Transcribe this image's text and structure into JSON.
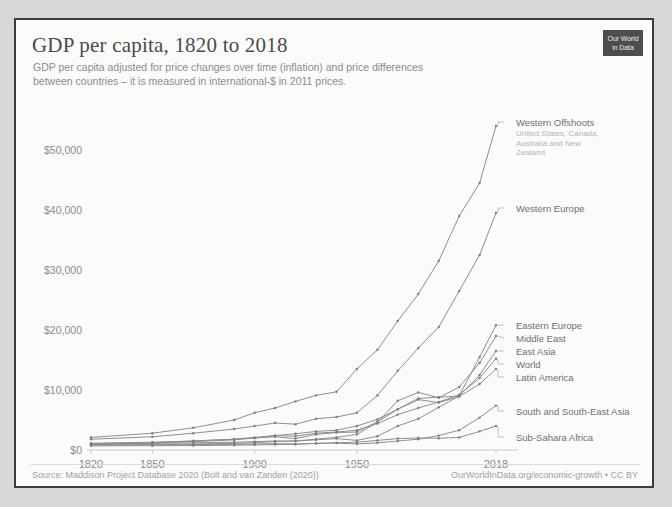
{
  "header": {
    "title": "GDP per capita, 1820 to 2018",
    "subtitle": "GDP per capita adjusted for price changes over time (inflation) and price differences between countries – it is measured in international-$ in 2011 prices.",
    "logo_line1": "Our World",
    "logo_line2": "in Data"
  },
  "footer": {
    "source": "Source: Maddison Project Database 2020 (Bolt and van Zanden (2020))",
    "credit": "OurWorldInData.org/economic-growth • CC BY"
  },
  "colors": {
    "line": "#8e8e8e",
    "text": "#8a8a8a",
    "background": "#fbfbfa",
    "frame": "#3a3a3a",
    "logo": "#4d4d4d"
  },
  "chart_data": {
    "type": "line",
    "title": "GDP per capita, 1820 to 2018",
    "subtitle": "GDP per capita adjusted for price changes over time (inflation) and price differences between countries – it is measured in international-$ in 2011 prices.",
    "xlabel": "",
    "ylabel": "",
    "grid": false,
    "legend_position": "right-inline",
    "xlim": [
      1820,
      2018
    ],
    "ylim": [
      0,
      57000
    ],
    "xticks": [
      1820,
      1850,
      1900,
      1950,
      2018
    ],
    "xtick_labels": [
      "1820",
      "1850",
      "1900",
      "1950",
      "2018"
    ],
    "yticks": [
      0,
      10000,
      20000,
      30000,
      40000,
      50000
    ],
    "ytick_labels": [
      "$0",
      "$10,000",
      "$20,000",
      "$30,000",
      "$40,000",
      "$50,000"
    ],
    "x": [
      1820,
      1850,
      1870,
      1890,
      1900,
      1910,
      1920,
      1930,
      1940,
      1950,
      1960,
      1970,
      1980,
      1990,
      2000,
      2010,
      2018
    ],
    "series": [
      {
        "name": "Western Offshoots",
        "sublabel": "United States, Canada, Australia and New Zealand",
        "values": [
          2100,
          2800,
          3700,
          5000,
          6200,
          7000,
          8100,
          9100,
          9700,
          13500,
          16700,
          21500,
          26000,
          31500,
          39000,
          44500,
          54000
        ]
      },
      {
        "name": "Western Europe",
        "sublabel": "",
        "values": [
          1800,
          2200,
          2800,
          3500,
          4000,
          4500,
          4300,
          5200,
          5500,
          6200,
          9100,
          13200,
          17000,
          20500,
          26500,
          32500,
          39500
        ]
      },
      {
        "name": "Eastern Europe",
        "sublabel": "",
        "values": [
          1100,
          1300,
          1500,
          1800,
          2000,
          2200,
          1900,
          2600,
          2900,
          3000,
          4700,
          6800,
          8600,
          8800,
          9000,
          15500,
          20800
        ]
      },
      {
        "name": "Middle East",
        "sublabel": "",
        "values": [
          1000,
          1100,
          1200,
          1300,
          1400,
          1500,
          1500,
          1800,
          2100,
          2600,
          4600,
          8200,
          9600,
          8700,
          10500,
          14500,
          19000
        ]
      },
      {
        "name": "East Asia",
        "sublabel": "",
        "values": [
          950,
          950,
          1000,
          1100,
          1200,
          1400,
          1500,
          1700,
          1900,
          1600,
          2300,
          4000,
          5200,
          7100,
          9000,
          12500,
          16500
        ]
      },
      {
        "name": "World",
        "sublabel": "",
        "values": [
          1100,
          1200,
          1500,
          1800,
          2100,
          2400,
          2300,
          2800,
          3000,
          3300,
          4400,
          5900,
          7000,
          8000,
          9200,
          12000,
          15200
        ]
      },
      {
        "name": "Latin America",
        "sublabel": "",
        "values": [
          1000,
          1200,
          1400,
          1700,
          2000,
          2400,
          2700,
          3100,
          3300,
          4000,
          5100,
          6800,
          8400,
          7900,
          8900,
          11000,
          13500
        ]
      },
      {
        "name": "South and South-East Asia",
        "sublabel": "",
        "values": [
          800,
          850,
          900,
          950,
          1000,
          1050,
          1000,
          1100,
          1150,
          1000,
          1200,
          1500,
          1800,
          2400,
          3300,
          5400,
          7400
        ]
      },
      {
        "name": "Sub-Sahara Africa",
        "sublabel": "",
        "values": [
          700,
          720,
          750,
          800,
          850,
          900,
          950,
          1100,
          1200,
          1300,
          1600,
          1900,
          2000,
          1950,
          2100,
          3100,
          4000
        ]
      }
    ],
    "legend_entries": [
      {
        "label": "Western Offshoots",
        "sublabel_lines": [
          "United States, Canada,",
          "Australia and New",
          "Zealand"
        ]
      },
      {
        "label": "Western Europe",
        "sublabel_lines": []
      },
      {
        "label": "Eastern Europe",
        "sublabel_lines": []
      },
      {
        "label": "Middle East",
        "sublabel_lines": []
      },
      {
        "label": "East Asia",
        "sublabel_lines": []
      },
      {
        "label": "World",
        "sublabel_lines": []
      },
      {
        "label": "Latin America",
        "sublabel_lines": []
      },
      {
        "label": "South and South-East Asia",
        "sublabel_lines": []
      },
      {
        "label": "Sub-Sahara Africa",
        "sublabel_lines": []
      }
    ]
  }
}
